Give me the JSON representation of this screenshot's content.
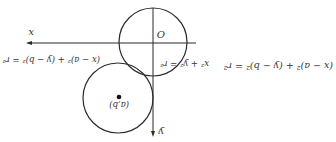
{
  "diagram": {
    "rotation_deg": 180,
    "colors": {
      "stroke": "#2b2b2b",
      "text": "#333333",
      "background": "#ffffff"
    },
    "axes": {
      "x_label": "x",
      "y_label": "y",
      "origin_label": "O"
    },
    "circles": [
      {
        "name": "origin-circle",
        "equation": "x² + y² = r²"
      },
      {
        "name": "shifted-circle",
        "equation": "(x − a)² + (y − b)² = r²",
        "center_label": "(a,b)"
      }
    ],
    "right_equation": "(x − a)² + (y − b)² = r²"
  }
}
